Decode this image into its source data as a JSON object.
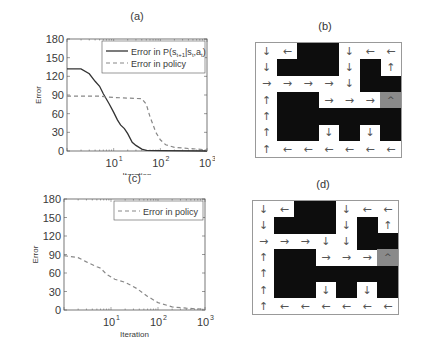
{
  "panels": {
    "a": {
      "label": "(a)"
    },
    "b": {
      "label": "(b)"
    },
    "c": {
      "label": "(c)"
    },
    "d": {
      "label": "(d)"
    }
  },
  "chart_data": [
    {
      "id": "a",
      "type": "line",
      "title": "(a)",
      "xlabel": "Iteration",
      "ylabel": "Error",
      "xscale": "log",
      "xlim": [
        1,
        1000
      ],
      "ylim": [
        0,
        180
      ],
      "xticks": [
        "10^1",
        "10^2",
        "10^3"
      ],
      "yticks": [
        0,
        30,
        60,
        90,
        120,
        150,
        180
      ],
      "legend_position": "upper right",
      "series": [
        {
          "name": "Error in P(s_{t+1}|s_t,a_t)",
          "style": "solid",
          "color": "#333333",
          "x": [
            1,
            2,
            3,
            4,
            5,
            6,
            8,
            10,
            12,
            14,
            17,
            20,
            25,
            30,
            40,
            50,
            100,
            1000
          ],
          "y": [
            132,
            132,
            124,
            112,
            104,
            92,
            76,
            62,
            50,
            42,
            36,
            28,
            14,
            9,
            3,
            1,
            0.5,
            0
          ]
        },
        {
          "name": "Error in policy",
          "style": "dashed",
          "color": "#888888",
          "x": [
            1,
            5,
            10,
            20,
            40,
            50,
            60,
            70,
            80,
            100,
            130,
            200,
            400,
            1000
          ],
          "y": [
            88,
            88,
            86,
            85,
            84,
            75,
            55,
            42,
            30,
            18,
            10,
            6,
            4,
            2
          ]
        }
      ]
    },
    {
      "id": "c",
      "type": "line",
      "title": "(c)",
      "xlabel": "Iteration",
      "ylabel": "Error",
      "xscale": "log",
      "xlim": [
        1,
        1000
      ],
      "ylim": [
        0,
        180
      ],
      "xticks": [
        "10^1",
        "10^2",
        "10^3"
      ],
      "yticks": [
        0,
        30,
        60,
        90,
        120,
        150,
        180
      ],
      "legend_position": "upper right",
      "series": [
        {
          "name": "Error in policy",
          "style": "dashed",
          "color": "#888888",
          "x": [
            1,
            2,
            3,
            5,
            6,
            8,
            12,
            20,
            35,
            60,
            100,
            200,
            400,
            1000
          ],
          "y": [
            88,
            85,
            78,
            70,
            68,
            58,
            50,
            45,
            35,
            22,
            12,
            5,
            3,
            1
          ]
        }
      ]
    },
    {
      "id": "b",
      "type": "heatmap",
      "title": "(b)",
      "description": "7x7 gridworld policy; X = wall (black), G = goal (gray)",
      "rows": [
        [
          "↓",
          "←",
          "X",
          "X",
          "↓",
          "←",
          "←"
        ],
        [
          "↓",
          "X",
          "X",
          "X",
          "↓",
          "X",
          "↑"
        ],
        [
          "→",
          "→",
          "→",
          "→",
          "↓",
          "X",
          "X"
        ],
        [
          "↑",
          "X",
          "X",
          "→",
          "→",
          "→",
          "G"
        ],
        [
          "↑",
          "X",
          "X",
          "X",
          "X",
          "X",
          "X"
        ],
        [
          "↑",
          "X",
          "X",
          "↓",
          "X",
          "↓",
          "X"
        ],
        [
          "↑",
          "←",
          "←",
          "←",
          "←",
          "←",
          "←"
        ]
      ]
    },
    {
      "id": "d",
      "type": "heatmap",
      "title": "(d)",
      "description": "7x7 gridworld policy; X = wall (black), G = goal (gray)",
      "rows": [
        [
          "↓",
          "←",
          "X",
          "X",
          "↓",
          "←",
          "←"
        ],
        [
          "↓",
          "X",
          "X",
          "X",
          "↓",
          "X",
          "↑"
        ],
        [
          "→",
          "→",
          "→",
          "↓",
          "↓",
          "X",
          "X"
        ],
        [
          "↑",
          "X",
          "X",
          "→",
          "→",
          "→",
          "G"
        ],
        [
          "↑",
          "X",
          "X",
          "X",
          "X",
          "X",
          "X"
        ],
        [
          "↑",
          "X",
          "X",
          "↓",
          "X",
          "↓",
          "X"
        ],
        [
          "↑",
          "←",
          "←",
          "←",
          "←",
          "←",
          "←"
        ]
      ]
    }
  ],
  "goal_glyph": "^",
  "colors": {
    "wall": "#0d0d0d",
    "goal": "#8a8a8a",
    "axis": "#555555",
    "solid": "#333333",
    "dashed": "#888888"
  }
}
